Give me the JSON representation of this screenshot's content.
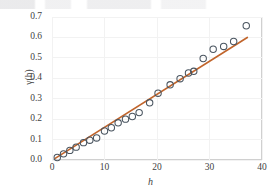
{
  "chart_data": {
    "type": "scatter",
    "title": "",
    "xlabel": "h",
    "ylabel": "γ(h)",
    "xlim": [
      0,
      40
    ],
    "ylim": [
      0.0,
      0.7
    ],
    "xticks": [
      "0",
      "10",
      "20",
      "30",
      "40"
    ],
    "yticks": [
      "0.0",
      "0.1",
      "0.2",
      "0.3",
      "0.4",
      "0.5",
      "0.6",
      "0.7"
    ],
    "grid": true,
    "legend": "none",
    "series": [
      {
        "name": "experimental semivariogram",
        "marker": "open-circle",
        "marker_color": "#4a5560",
        "points": [
          {
            "x": 1.0,
            "y": 0.012
          },
          {
            "x": 2.2,
            "y": 0.03
          },
          {
            "x": 3.4,
            "y": 0.047
          },
          {
            "x": 4.6,
            "y": 0.063
          },
          {
            "x": 6.0,
            "y": 0.085
          },
          {
            "x": 7.2,
            "y": 0.097
          },
          {
            "x": 8.5,
            "y": 0.108
          },
          {
            "x": 10.0,
            "y": 0.142
          },
          {
            "x": 11.3,
            "y": 0.158
          },
          {
            "x": 12.6,
            "y": 0.182
          },
          {
            "x": 14.0,
            "y": 0.2
          },
          {
            "x": 15.3,
            "y": 0.213
          },
          {
            "x": 16.6,
            "y": 0.232
          },
          {
            "x": 18.6,
            "y": 0.28
          },
          {
            "x": 20.2,
            "y": 0.327
          },
          {
            "x": 22.5,
            "y": 0.368
          },
          {
            "x": 24.4,
            "y": 0.398
          },
          {
            "x": 26.0,
            "y": 0.426
          },
          {
            "x": 27.0,
            "y": 0.434
          },
          {
            "x": 28.8,
            "y": 0.497
          },
          {
            "x": 30.7,
            "y": 0.542
          },
          {
            "x": 32.7,
            "y": 0.556
          },
          {
            "x": 34.6,
            "y": 0.58
          },
          {
            "x": 37.0,
            "y": 0.657
          }
        ]
      }
    ],
    "trendline": {
      "name": "fitted linear model",
      "color": "#c1652c",
      "x_start": 0.6,
      "y_start": 0.008,
      "x_end": 37.2,
      "y_end": 0.6
    }
  }
}
